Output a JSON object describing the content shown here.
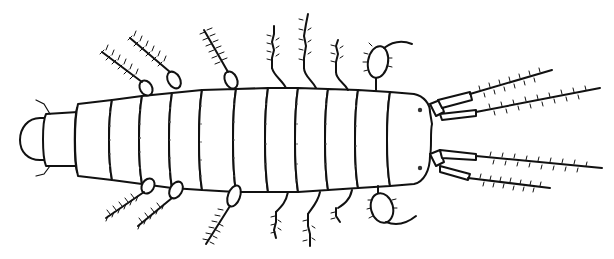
{
  "image": {
    "subject": "Line drawing of an insect larva, dorsal view",
    "background_color": "#ffffff",
    "ink_color": "#111111",
    "orientation": "head at right, posterior at left",
    "features": {
      "body_segments": 12,
      "thoracic_legs_pairs": 3,
      "abdominal_appendage_pairs": 4,
      "anterior_appendage_pairs": 4,
      "antennae_like_setose_projections": 4,
      "claws": 2,
      "eyespots": 2
    }
  }
}
